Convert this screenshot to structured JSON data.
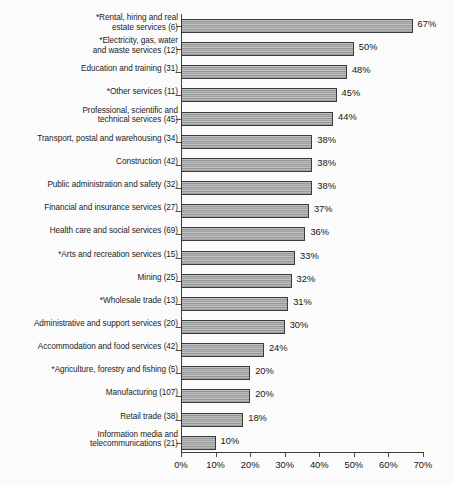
{
  "chart_data": {
    "type": "bar",
    "orientation": "horizontal",
    "title": "",
    "xlabel": "",
    "ylabel": "",
    "xlim": [
      0,
      70
    ],
    "xticks": [
      "0%",
      "10%",
      "20%",
      "30%",
      "40%",
      "50%",
      "60%",
      "70%"
    ],
    "xtick_values": [
      0,
      10,
      20,
      30,
      40,
      50,
      60,
      70
    ],
    "grid": false,
    "legend": false,
    "value_suffix": "%",
    "categories": [
      "*Rental, hiring and real estate services (6)",
      "*Electricity, gas, water and waste services (12)",
      "Education and training (31)",
      "*Other services (11)",
      "Professional, scientific and technical services (45)",
      "Transport, postal and warehousing (34)",
      "Construction (42)",
      "Public administration and safety (32)",
      "Financial and insurance services (27)",
      "Health care and social services (69)",
      "*Arts and recreation services (15)",
      "Mining (25)",
      "*Wholesale trade (13)",
      "Administrative and support services (20)",
      "Accommodation and food services (42)",
      "*Agriculture, forestry and fishing (5)",
      "Manufacturing (107)",
      "Retail trade (38)",
      "Information media and telecommunications (21)"
    ],
    "values": [
      67,
      50,
      48,
      45,
      44,
      38,
      38,
      38,
      37,
      36,
      33,
      32,
      31,
      30,
      24,
      20,
      20,
      18,
      10
    ],
    "value_labels": [
      "67%",
      "50%",
      "48%",
      "45%",
      "44%",
      "38%",
      "38%",
      "38%",
      "37%",
      "36%",
      "33%",
      "32%",
      "31%",
      "30%",
      "24%",
      "20%",
      "20%",
      "18%",
      "10%"
    ],
    "category_lines": [
      [
        "*Rental, hiring and real",
        "estate services (6)"
      ],
      [
        "*Electricity, gas, water",
        "and waste services (12)"
      ],
      [
        "Education and training (31)"
      ],
      [
        "*Other services (11)"
      ],
      [
        "Professional, scientific and",
        "technical services (45)"
      ],
      [
        "Transport, postal and warehousing (34)"
      ],
      [
        "Construction (42)"
      ],
      [
        "Public administration and safety (32)"
      ],
      [
        "Financial and insurance services (27)"
      ],
      [
        "Health care and social services (69)"
      ],
      [
        "*Arts and recreation services (15)"
      ],
      [
        "Mining (25)"
      ],
      [
        "*Wholesale trade (13)"
      ],
      [
        "Administrative and support services (20)"
      ],
      [
        "Accommodation and food services (42)"
      ],
      [
        "*Agriculture, forestry and fishing (5)"
      ],
      [
        "Manufacturing (107)"
      ],
      [
        "Retail trade (38)"
      ],
      [
        "Information media and",
        "telecommunications (21)"
      ]
    ],
    "colors": {
      "bar_fill": "#a8a8a8",
      "bar_border": "#3a3a3a",
      "axis": "#3f3f3f",
      "text": "#161616",
      "background": "#fbfbfb"
    }
  }
}
